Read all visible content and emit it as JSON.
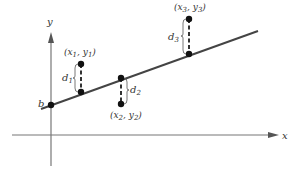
{
  "diagram": {
    "title": "",
    "colors": {
      "axis": "#777777",
      "line": "#444444",
      "point": "#111111",
      "dashed": "#333333",
      "text": "#333333"
    },
    "axes": {
      "x_label": "x",
      "y_label": "y"
    },
    "intercept": {
      "label": "b"
    },
    "points": [
      {
        "label_x": "x",
        "sub_x": "1",
        "label_y": "y",
        "sub_y": "1",
        "distance": "d",
        "distance_sub": "1"
      },
      {
        "label_x": "x",
        "sub_x": "2",
        "label_y": "y",
        "sub_y": "2",
        "distance": "d",
        "distance_sub": "2"
      },
      {
        "label_x": "x",
        "sub_x": "3",
        "label_y": "y",
        "sub_y": "3",
        "distance": "d",
        "distance_sub": "3"
      }
    ],
    "punct": {
      "open": "(",
      "comma": ", ",
      "close": ")"
    }
  }
}
